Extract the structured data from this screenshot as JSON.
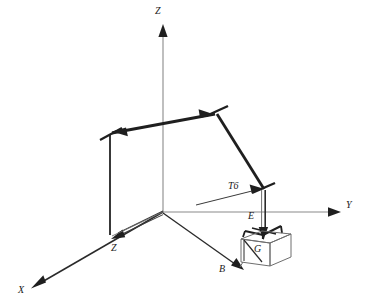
{
  "figure": {
    "type": "technical-line-diagram",
    "background_color": "#ffffff",
    "ink_color": "#1f1f1f",
    "thin_line_color": "#8a8a8a",
    "box_line_color": "#6e6e6e"
  },
  "axes": {
    "origin_label": "",
    "z_label": "Z",
    "y_label": "Y",
    "x_label": "X",
    "z_secondary_label": "Z"
  },
  "frames": [
    {
      "id": "t6",
      "label": "T6"
    },
    {
      "id": "e",
      "label": "E"
    },
    {
      "id": "g",
      "label": "G"
    },
    {
      "id": "b",
      "label": "B"
    }
  ],
  "labels": {
    "z_axis": "Z",
    "y_axis": "Y",
    "x_axis": "X",
    "z_base": "Z",
    "t6": "T6",
    "e": "E",
    "g": "G",
    "b": "B"
  }
}
